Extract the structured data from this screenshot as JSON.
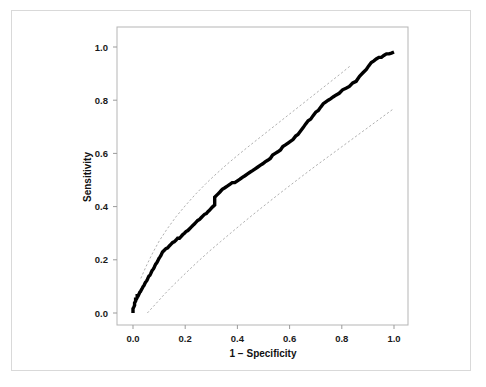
{
  "figure": {
    "background_color": "#ffffff",
    "outer_border_color": "#d9d9d9"
  },
  "chart_data": {
    "type": "line",
    "title": "",
    "subtitle": "",
    "xlabel": "1 − Specificity",
    "ylabel": "Sensitivity",
    "xlim": [
      0.0,
      1.0
    ],
    "ylim": [
      0.0,
      1.0
    ],
    "grid": false,
    "legend": null,
    "legend_position": "none",
    "xticks": [
      "0.0",
      "0.2",
      "0.4",
      "0.6",
      "0.8",
      "1.0"
    ],
    "xtick_values": [
      0.0,
      0.2,
      0.4,
      0.6,
      0.8,
      1.0
    ],
    "yticks": [
      "0.0",
      "0.2",
      "0.4",
      "0.6",
      "0.8",
      "1.0"
    ],
    "ytick_values": [
      0.0,
      0.2,
      0.4,
      0.6,
      0.8,
      1.0
    ],
    "annotations": [],
    "series": [
      {
        "name": "ROC curve",
        "style": "thick-black-step",
        "color": "#000000",
        "line_width": 3.4,
        "x": [
          0.0,
          0.0,
          0.003,
          0.006,
          0.006,
          0.01,
          0.01,
          0.013,
          0.016,
          0.016,
          0.02,
          0.023,
          0.026,
          0.029,
          0.032,
          0.036,
          0.039,
          0.042,
          0.045,
          0.048,
          0.052,
          0.055,
          0.058,
          0.061,
          0.065,
          0.068,
          0.071,
          0.074,
          0.078,
          0.081,
          0.084,
          0.087,
          0.09,
          0.094,
          0.097,
          0.1,
          0.103,
          0.107,
          0.11,
          0.113,
          0.12,
          0.126,
          0.133,
          0.139,
          0.145,
          0.152,
          0.158,
          0.165,
          0.171,
          0.178,
          0.184,
          0.19,
          0.197,
          0.203,
          0.21,
          0.216,
          0.223,
          0.229,
          0.236,
          0.242,
          0.248,
          0.255,
          0.261,
          0.268,
          0.274,
          0.281,
          0.287,
          0.294,
          0.3,
          0.306,
          0.313,
          0.313,
          0.32,
          0.326,
          0.333,
          0.342,
          0.352,
          0.361,
          0.371,
          0.38,
          0.39,
          0.4,
          0.41,
          0.419,
          0.429,
          0.439,
          0.448,
          0.458,
          0.468,
          0.477,
          0.487,
          0.497,
          0.506,
          0.516,
          0.526,
          0.535,
          0.545,
          0.555,
          0.565,
          0.574,
          0.584,
          0.594,
          0.603,
          0.613,
          0.623,
          0.632,
          0.642,
          0.652,
          0.661,
          0.671,
          0.681,
          0.69,
          0.7,
          0.71,
          0.719,
          0.729,
          0.739,
          0.748,
          0.758,
          0.768,
          0.777,
          0.79,
          0.803,
          0.816,
          0.829,
          0.842,
          0.855,
          0.868,
          0.881,
          0.894,
          0.903,
          0.913,
          0.923,
          0.932,
          0.942,
          0.952,
          0.961,
          0.971,
          0.981,
          0.99,
          1.0
        ],
        "y": [
          0.0,
          0.016,
          0.022,
          0.029,
          0.038,
          0.045,
          0.052,
          0.052,
          0.058,
          0.065,
          0.065,
          0.071,
          0.078,
          0.081,
          0.087,
          0.094,
          0.1,
          0.103,
          0.11,
          0.116,
          0.12,
          0.126,
          0.133,
          0.139,
          0.142,
          0.148,
          0.155,
          0.161,
          0.165,
          0.171,
          0.178,
          0.184,
          0.187,
          0.194,
          0.2,
          0.206,
          0.21,
          0.216,
          0.223,
          0.229,
          0.236,
          0.242,
          0.245,
          0.252,
          0.258,
          0.265,
          0.268,
          0.274,
          0.281,
          0.281,
          0.287,
          0.294,
          0.3,
          0.306,
          0.31,
          0.316,
          0.323,
          0.329,
          0.335,
          0.342,
          0.348,
          0.352,
          0.358,
          0.365,
          0.371,
          0.374,
          0.381,
          0.387,
          0.394,
          0.4,
          0.406,
          0.435,
          0.442,
          0.448,
          0.455,
          0.465,
          0.471,
          0.477,
          0.484,
          0.49,
          0.49,
          0.497,
          0.503,
          0.51,
          0.516,
          0.523,
          0.529,
          0.535,
          0.542,
          0.548,
          0.555,
          0.561,
          0.568,
          0.574,
          0.581,
          0.594,
          0.6,
          0.606,
          0.613,
          0.626,
          0.632,
          0.639,
          0.645,
          0.652,
          0.665,
          0.671,
          0.684,
          0.697,
          0.71,
          0.723,
          0.729,
          0.742,
          0.755,
          0.761,
          0.774,
          0.787,
          0.794,
          0.8,
          0.806,
          0.813,
          0.819,
          0.826,
          0.839,
          0.845,
          0.852,
          0.865,
          0.871,
          0.89,
          0.903,
          0.916,
          0.929,
          0.942,
          0.948,
          0.955,
          0.961,
          0.961,
          0.968,
          0.974,
          0.974,
          0.977,
          0.981
        ]
      },
      {
        "name": "Upper confidence band",
        "style": "thin-dotted",
        "color": "#9a9a9a",
        "line_width": 0.8,
        "x": [
          0.03,
          0.05,
          0.075,
          0.1,
          0.13,
          0.165,
          0.2,
          0.24,
          0.28,
          0.32,
          0.36,
          0.4,
          0.44,
          0.48,
          0.52,
          0.56,
          0.6,
          0.64,
          0.68,
          0.72,
          0.76,
          0.8,
          0.83
        ],
        "y": [
          0.13,
          0.175,
          0.225,
          0.27,
          0.315,
          0.362,
          0.403,
          0.447,
          0.487,
          0.524,
          0.559,
          0.592,
          0.624,
          0.655,
          0.686,
          0.717,
          0.748,
          0.779,
          0.81,
          0.841,
          0.872,
          0.903,
          0.927
        ]
      },
      {
        "name": "Lower confidence band",
        "style": "thin-dotted",
        "color": "#9a9a9a",
        "line_width": 0.8,
        "x": [
          0.055,
          0.085,
          0.12,
          0.16,
          0.2,
          0.245,
          0.29,
          0.335,
          0.38,
          0.425,
          0.47,
          0.515,
          0.56,
          0.605,
          0.65,
          0.7,
          0.75,
          0.8,
          0.85,
          0.9,
          0.95,
          1.0
        ],
        "y": [
          0.0,
          0.032,
          0.07,
          0.11,
          0.148,
          0.19,
          0.23,
          0.268,
          0.305,
          0.342,
          0.378,
          0.413,
          0.448,
          0.482,
          0.516,
          0.553,
          0.589,
          0.625,
          0.661,
          0.697,
          0.733,
          0.769
        ]
      }
    ]
  }
}
